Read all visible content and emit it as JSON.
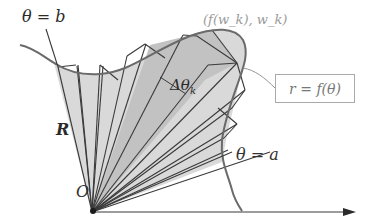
{
  "diagram": {
    "type": "polar-area-approximation",
    "labels": {
      "theta_b": "θ = b",
      "theta_a": "θ = a",
      "point": "(f(w_k), w_k)",
      "delta_theta": "Δθ",
      "delta_theta_sub": "k",
      "radius": "R",
      "origin": "O",
      "equation": "r = f(θ)"
    },
    "colors": {
      "region_fill": "#d9d9d9",
      "highlight_fill": "#bcbcbc",
      "stroke": "#3a3a3a",
      "curve": "#6a6a6a",
      "faint_label": "#9a9a9a"
    },
    "wedge_count": 8,
    "has_axis_arrow": true
  }
}
